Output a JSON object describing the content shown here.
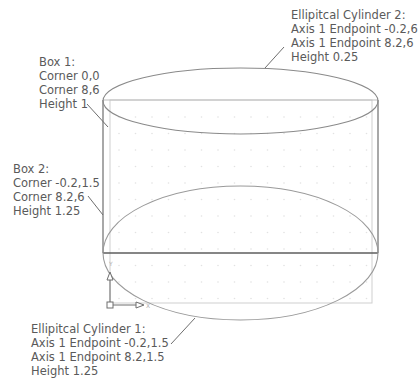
{
  "canvas": {
    "width": 418,
    "height": 392,
    "background": "#ffffff"
  },
  "colors": {
    "dark_line": "#6e6e6e",
    "light_line": "#c8c8c8",
    "ellipse_line": "#8a8a8a",
    "text": "#5a5a5a",
    "grid_dot": "#e2e2e2"
  },
  "annotations": {
    "box1": {
      "title": "Box 1:",
      "lines": [
        "Corner 0,0",
        "Corner 8,6",
        "Height 1"
      ]
    },
    "box2": {
      "title": "Box 2:",
      "lines": [
        "Corner -0.2,1.5",
        "Corner 8.2,6",
        "Height 1.25"
      ]
    },
    "cyl1": {
      "title": "Ellipitcal Cylinder 1:",
      "lines": [
        "Axis 1 Endpoint -0.2,1.5",
        "Axis 1 Endpoint 8.2,1.5",
        "Height 1.25"
      ]
    },
    "cyl2": {
      "title": "Ellipitcal Cylinder 2:",
      "lines": [
        "Axis 1 Endpoint -0.2,6",
        "Axis 1 Endpoint 8.2,6",
        "Height 0.25"
      ]
    }
  },
  "ucs_icon": {
    "name": "ucs-icon",
    "axes": [
      "X",
      "Y"
    ]
  }
}
